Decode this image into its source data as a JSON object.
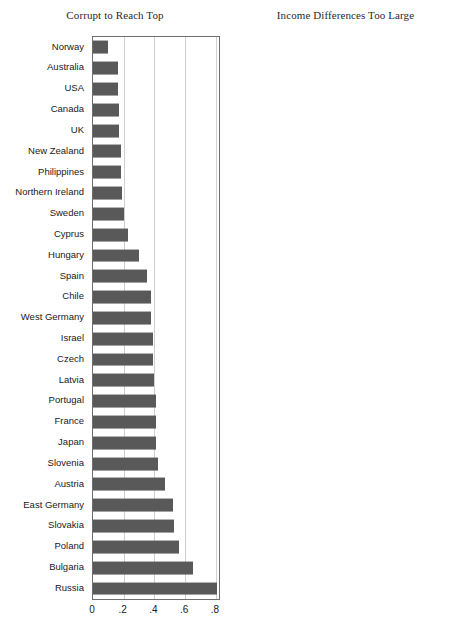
{
  "chart_data": [
    {
      "type": "bar",
      "orientation": "horizontal",
      "title": "Corrupt to Reach Top",
      "xlabel": "",
      "ylabel": "",
      "xlim": [
        0,
        0.82
      ],
      "grid": true,
      "xticks": [
        "0",
        ".2",
        ".4",
        ".6",
        ".8"
      ],
      "xtick_values": [
        0,
        0.2,
        0.4,
        0.6,
        0.8
      ],
      "categories": [
        "Norway",
        "Australia",
        "USA",
        "Canada",
        "UK",
        "New Zealand",
        "Philippines",
        "Northern Ireland",
        "Sweden",
        "Cyprus",
        "Hungary",
        "Spain",
        "Chile",
        "West Germany",
        "Israel",
        "Czech",
        "Latvia",
        "Portugal",
        "France",
        "Japan",
        "Slovenia",
        "Austria",
        "East Germany",
        "Slovakia",
        "Poland",
        "Bulgaria",
        "Russia"
      ],
      "values": [
        0.1,
        0.16,
        0.16,
        0.17,
        0.17,
        0.18,
        0.18,
        0.19,
        0.2,
        0.23,
        0.3,
        0.35,
        0.38,
        0.38,
        0.39,
        0.39,
        0.4,
        0.41,
        0.41,
        0.41,
        0.42,
        0.47,
        0.52,
        0.53,
        0.56,
        0.65,
        0.81
      ]
    },
    {
      "type": "bar",
      "orientation": "horizontal",
      "title": "Income Differences Too Large",
      "xlabel": "",
      "ylabel": "",
      "xlim": [
        0,
        1.0
      ],
      "grid": true,
      "xticks": [
        "0",
        ".2",
        ".4",
        ".6",
        ".8",
        "1"
      ],
      "xtick_values": [
        0,
        0.2,
        0.4,
        0.6,
        0.8,
        1.0
      ],
      "categories": [
        "Philippines",
        "Cyprus",
        "USA",
        "Japan",
        "Northern Ireland",
        "Canada",
        "Australia",
        "Sweden",
        "Norway",
        "New Zealand",
        "West Germany",
        "UK",
        "Austria",
        "France",
        "Czech",
        "Poland",
        "Spain",
        "Israel",
        "Slovenia",
        "Chile",
        "Hungary",
        "East Germany",
        "Slovakia",
        "Russia",
        "Portugal",
        "Latvia",
        "Bulgaria"
      ],
      "values": [
        0.69,
        0.69,
        0.7,
        0.72,
        0.73,
        0.73,
        0.74,
        0.74,
        0.75,
        0.75,
        0.78,
        0.83,
        0.86,
        0.87,
        0.87,
        0.88,
        0.88,
        0.89,
        0.9,
        0.91,
        0.92,
        0.93,
        0.93,
        0.94,
        0.95,
        0.96,
        0.96
      ]
    }
  ],
  "style": {
    "bar_color": "#595959",
    "grid_color": "#cfcfcf",
    "axis_color": "#6e6e6e",
    "background": "#ffffff"
  }
}
